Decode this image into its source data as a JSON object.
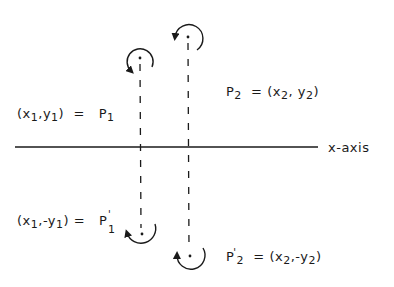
{
  "diagram": {
    "type": "reflection-about-x-axis",
    "axis": {
      "label": "x-axis",
      "y": 147,
      "x_start": 15,
      "x_end": 318
    },
    "colors": {
      "stroke": "#1a1a1a",
      "background": "#ffffff"
    },
    "points": [
      {
        "id": "P1",
        "x": 140,
        "y": 58,
        "label_name": "P",
        "label_sub": "1",
        "coords": "(x1,y1)"
      },
      {
        "id": "P2",
        "x": 188,
        "y": 37,
        "label_name": "P",
        "label_sub": "2",
        "coords": "(x2, y2)"
      },
      {
        "id": "P1_prime",
        "x": 142,
        "y": 234,
        "label_name": "P'",
        "label_sub": "1",
        "coords": "(x1,-y1)"
      },
      {
        "id": "P2_prime",
        "x": 190,
        "y": 256,
        "label_name": "P'",
        "label_sub": "2",
        "coords": "(x2,-y2)"
      }
    ]
  },
  "labels": {
    "p1": {
      "open": "(x",
      "s1": "1",
      "mid": ",y",
      "s2": "1",
      "close": ")",
      "eq": "=",
      "name": "P",
      "sub": "1"
    },
    "p2": {
      "name": "P",
      "sub": "2",
      "eq": "=",
      "open": "(x",
      "s1": "2",
      "mid": ", y",
      "s2": "2",
      "close": ")"
    },
    "p1p": {
      "open": "(x",
      "s1": "1",
      "mid": ",-y",
      "s2": "1",
      "close": ")",
      "eq": "=",
      "name": "P",
      "prime": "'",
      "sub": "1"
    },
    "p2p": {
      "name": "P",
      "prime": "'",
      "sub": "2",
      "eq": "=",
      "open": "(x",
      "s1": "2",
      "mid": ",-y",
      "s2": "2",
      "close": ")"
    },
    "axis": "x-axis"
  }
}
